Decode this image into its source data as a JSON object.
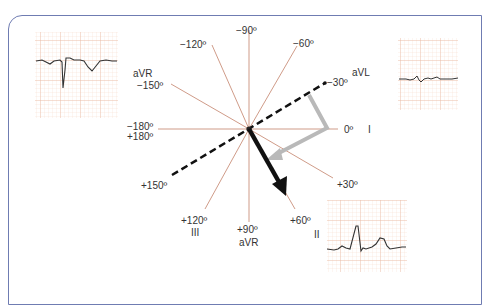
{
  "diagram": {
    "center": {
      "x": 249,
      "y": 129
    },
    "axes": [
      {
        "angle": -90,
        "label": "−90º",
        "lead": ""
      },
      {
        "angle": -60,
        "label": "−60º",
        "lead": ""
      },
      {
        "angle": -30,
        "label": "−30º",
        "lead": "aVL"
      },
      {
        "angle": 0,
        "label": "0º",
        "lead": "I"
      },
      {
        "angle": 30,
        "label": "+30º",
        "lead": ""
      },
      {
        "angle": 60,
        "label": "+60º",
        "lead": "II"
      },
      {
        "angle": 90,
        "label": "+90º",
        "lead": "aVR"
      },
      {
        "angle": 120,
        "label": "+120º",
        "lead": "III"
      },
      {
        "angle": 150,
        "label": "+150º",
        "lead": ""
      },
      {
        "angle": -150,
        "label": "−150º",
        "lead": "aVR"
      },
      {
        "angle": -120,
        "label": "−120º",
        "lead": ""
      },
      {
        "angle": 180,
        "label": "−180º\n+180º",
        "lead": ""
      }
    ],
    "labels": {
      "m90": "−90º",
      "m60": "−60º",
      "m30": "−30º",
      "zero": "0º",
      "p30": "+30º",
      "p60": "+60º",
      "p90": "+90º",
      "p120": "+120º",
      "p150": "+150º",
      "m150": "−150º",
      "m120": "−120º",
      "m180": "−180º",
      "p180": "+180º"
    },
    "leads": {
      "avl": "aVL",
      "i": "I",
      "ii": "II",
      "iii": "III",
      "avr_top": "aVR",
      "avr_bottom": "aVR"
    },
    "vectors": [
      {
        "name": "dashed-axis",
        "from_angle": 150,
        "to_angle": -30,
        "style": "dashed black"
      },
      {
        "name": "result-vector",
        "angle": 60,
        "style": "solid black arrow"
      },
      {
        "name": "construction-vector",
        "style": "grey bent arrow"
      }
    ],
    "ecg_strips": [
      {
        "position": "top-left",
        "lead": "aVR",
        "description": "deep negative QRS, inverted T"
      },
      {
        "position": "top-right",
        "lead": "aVL",
        "description": "isoelectric, small biphasic QRS"
      },
      {
        "position": "bottom-right",
        "lead": "II",
        "description": "tall positive QRS, upright T"
      }
    ],
    "colors": {
      "frame": "#6f7cb2",
      "spoke": "#c9907a",
      "grid": "#f3c9b5",
      "trace": "#333333",
      "grey_arrow": "#b9b9b9"
    }
  }
}
